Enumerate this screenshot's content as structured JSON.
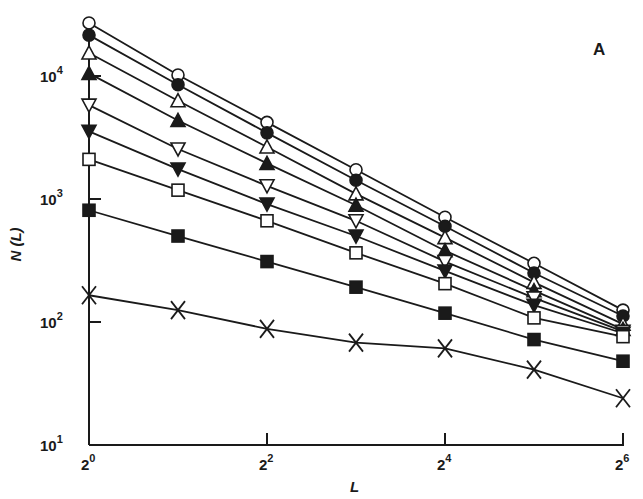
{
  "chart_data": {
    "type": "line",
    "title": "",
    "panel_label": "A",
    "xlabel": "L",
    "ylabel": "N (L)",
    "xscale": "log2",
    "yscale": "log10",
    "xlim": [
      1,
      64
    ],
    "ylim": [
      10,
      30000
    ],
    "grid": false,
    "legend": "none",
    "x_ticks": [
      {
        "base": "2",
        "exp": "0",
        "value": 1
      },
      {
        "base": "2",
        "exp": "2",
        "value": 4
      },
      {
        "base": "2",
        "exp": "4",
        "value": 16
      },
      {
        "base": "2",
        "exp": "6",
        "value": 64
      }
    ],
    "y_ticks": [
      {
        "base": "10",
        "exp": "1",
        "value": 10
      },
      {
        "base": "10",
        "exp": "2",
        "value": 100
      },
      {
        "base": "10",
        "exp": "3",
        "value": 1000
      },
      {
        "base": "10",
        "exp": "4",
        "value": 10000
      }
    ],
    "x": [
      1,
      2,
      4,
      8,
      16,
      32,
      64
    ],
    "series": [
      {
        "name": "open-circle",
        "marker": "circle",
        "filled": false,
        "values": [
          27000,
          10200,
          4200,
          1730,
          710,
          300,
          125
        ]
      },
      {
        "name": "filled-circle",
        "marker": "circle",
        "filled": true,
        "values": [
          21500,
          8500,
          3450,
          1420,
          600,
          250,
          112
        ]
      },
      {
        "name": "open-triangle-up",
        "marker": "triangle-up",
        "filled": false,
        "values": [
          15400,
          6300,
          2650,
          1100,
          485,
          210,
          96
        ]
      },
      {
        "name": "filled-triangle-up",
        "marker": "triangle-up",
        "filled": true,
        "values": [
          10500,
          4350,
          1950,
          890,
          380,
          180,
          87
        ]
      },
      {
        "name": "open-triangle-down",
        "marker": "triangle-down",
        "filled": false,
        "values": [
          5800,
          2550,
          1280,
          665,
          310,
          157,
          84
        ]
      },
      {
        "name": "filled-triangle-down",
        "marker": "triangle-down",
        "filled": true,
        "values": [
          3550,
          1750,
          910,
          500,
          260,
          137,
          81
        ]
      },
      {
        "name": "open-square",
        "marker": "square",
        "filled": false,
        "values": [
          2100,
          1180,
          665,
          365,
          205,
          108,
          76
        ]
      },
      {
        "name": "filled-square",
        "marker": "square",
        "filled": true,
        "values": [
          810,
          500,
          310,
          192,
          118,
          72,
          48
        ]
      },
      {
        "name": "cross",
        "marker": "x",
        "filled": false,
        "values": [
          165,
          125,
          88,
          68,
          61,
          41,
          24
        ]
      }
    ]
  },
  "colors": {
    "ink": "#1a1a1a",
    "background": "#ffffff"
  }
}
